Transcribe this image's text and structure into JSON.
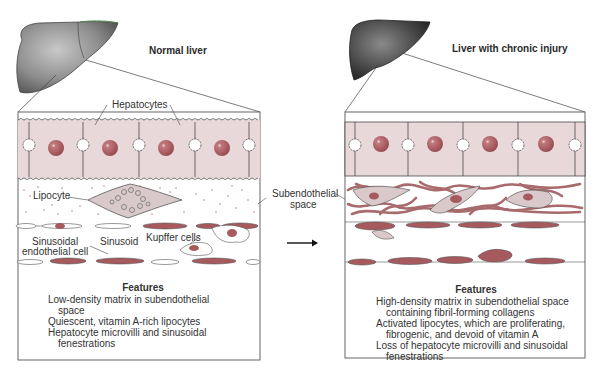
{
  "left_panel": {
    "title": "Normal liver",
    "labels": {
      "hepatocytes": "Hepatocytes",
      "lipocyte": "Lipocyte",
      "sinusoidal_endothelial_cell_line1": "Sinusoidal",
      "sinusoidal_endothelial_cell_line2": "endothelial cell",
      "sinusoid": "Sinusoid",
      "kupffer_cells": "Kupffer cells"
    },
    "features": {
      "heading": "Features",
      "items": [
        "Low-density matrix in subendothelial space",
        "Quiescent, vitamin A-rich lipocytes",
        "Hepatocyte microvilli and sinusoidal fenestrations"
      ]
    }
  },
  "middle": {
    "subendothelial_label_line1": "Subendothelial",
    "subendothelial_label_line2": "space",
    "arrow": "right-arrow"
  },
  "right_panel": {
    "title": "Liver with chronic injury",
    "features": {
      "heading": "Features",
      "items": [
        "High-density matrix in subendothelial space containing fibril-forming collagens",
        "Activated lipocytes, which are proliferating, fibrogenic, and devoid of vitamin A",
        "Loss of hepatocyte microvilli and sinusoidal fenestrations"
      ]
    }
  },
  "colors": {
    "hepatocyte_fill": "#e8d6d8",
    "nucleus": "#a65a5e",
    "matrix_dots": "#b87a7e",
    "collagen": "#a86a6c",
    "lipocyte_fill": "#d9c9cb",
    "normal_liver": "#8a8a8a",
    "injured_liver": "#4a4a4a",
    "outline": "#333333"
  }
}
